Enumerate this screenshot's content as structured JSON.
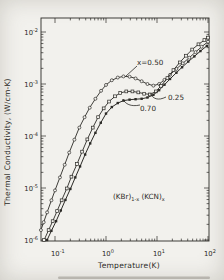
{
  "figure": {
    "background": "#f2f1ed",
    "ink": "#2b2a26"
  },
  "chart_data": {
    "type": "line",
    "title": "",
    "xlabel": "Temperature(K)",
    "ylabel": "Thermal Conductivity, (W/cm-K)",
    "x_scale": "log",
    "y_scale": "log",
    "xlim": [
      0.053,
      100
    ],
    "ylim": [
      1e-06,
      0.0185
    ],
    "grid": false,
    "legend_position": "inline-labels",
    "x_tick_exponents": [
      -1,
      0,
      1,
      2
    ],
    "y_tick_exponents": [
      -2,
      -3,
      -4,
      -5,
      -6
    ],
    "annotation": {
      "base1": "(KBr)",
      "sub1": "1-x",
      "base2": "(KCN)",
      "sub2": "x"
    },
    "series": [
      {
        "name": "x-0.50",
        "label": "x=0.50",
        "marker": "open-circle",
        "points": [
          [
            0.053,
            1.55e-06
          ],
          [
            0.06,
            2.2e-06
          ],
          [
            0.07,
            3.4e-06
          ],
          [
            0.085,
            5.8e-06
          ],
          [
            0.1,
            9e-06
          ],
          [
            0.125,
            1.6e-05
          ],
          [
            0.155,
            2.8e-05
          ],
          [
            0.19,
            4.8e-05
          ],
          [
            0.24,
            8.5e-05
          ],
          [
            0.3,
            0.000145
          ],
          [
            0.38,
            0.00023
          ],
          [
            0.48,
            0.00035
          ],
          [
            0.62,
            0.00052
          ],
          [
            0.8,
            0.00074
          ],
          [
            1.0,
            0.00096
          ],
          [
            1.3,
            0.00118
          ],
          [
            1.7,
            0.00133
          ],
          [
            2.2,
            0.0014
          ],
          [
            2.9,
            0.00138
          ],
          [
            3.8,
            0.00128
          ],
          [
            5.0,
            0.00113
          ],
          [
            6.5,
            0.001
          ],
          [
            8.5,
            0.00093
          ],
          [
            11,
            0.001
          ],
          [
            14,
            0.0012
          ],
          [
            18,
            0.0015
          ],
          [
            24,
            0.00195
          ],
          [
            32,
            0.0025
          ],
          [
            43,
            0.0032
          ],
          [
            57,
            0.0041
          ],
          [
            75,
            0.0052
          ],
          [
            100,
            0.0065
          ]
        ]
      },
      {
        "name": "x-0.25",
        "label": "0.25",
        "marker": "open-square",
        "points": [
          [
            0.061,
            1e-06
          ],
          [
            0.075,
            1.55e-06
          ],
          [
            0.09,
            2.3e-06
          ],
          [
            0.11,
            3.6e-06
          ],
          [
            0.135,
            5.8e-06
          ],
          [
            0.17,
            9.8e-06
          ],
          [
            0.21,
            1.65e-05
          ],
          [
            0.27,
            2.9e-05
          ],
          [
            0.34,
            5e-05
          ],
          [
            0.43,
            8.6e-05
          ],
          [
            0.55,
            0.000145
          ],
          [
            0.7,
            0.00023
          ],
          [
            0.9,
            0.00034
          ],
          [
            1.15,
            0.00046
          ],
          [
            1.5,
            0.00058
          ],
          [
            1.9,
            0.00067
          ],
          [
            2.5,
            0.00072
          ],
          [
            3.3,
            0.00072
          ],
          [
            4.3,
            0.00069
          ],
          [
            5.6,
            0.00065
          ],
          [
            7.3,
            0.00063
          ],
          [
            9.5,
            0.00072
          ],
          [
            12,
            0.00092
          ],
          [
            16,
            0.0013
          ],
          [
            21,
            0.00185
          ],
          [
            28,
            0.0026
          ],
          [
            37,
            0.0035
          ],
          [
            49,
            0.0046
          ],
          [
            65,
            0.0058
          ],
          [
            85,
            0.007
          ],
          [
            100,
            0.0078
          ]
        ]
      },
      {
        "name": "x-0.70",
        "label": "0.70",
        "marker": "filled-square",
        "points": [
          [
            0.07,
            1e-06
          ],
          [
            0.085,
            1.5e-06
          ],
          [
            0.105,
            2.3e-06
          ],
          [
            0.13,
            3.7e-06
          ],
          [
            0.16,
            5.9e-06
          ],
          [
            0.2,
            9.6e-06
          ],
          [
            0.25,
            1.6e-05
          ],
          [
            0.31,
            2.6e-05
          ],
          [
            0.39,
            4.4e-05
          ],
          [
            0.49,
            7.2e-05
          ],
          [
            0.62,
            0.000115
          ],
          [
            0.79,
            0.00018
          ],
          [
            1.0,
            0.00027
          ],
          [
            1.3,
            0.00036
          ],
          [
            1.7,
            0.00043
          ],
          [
            2.2,
            0.00048
          ],
          [
            2.9,
            0.0005
          ],
          [
            3.8,
            0.00051
          ],
          [
            5.0,
            0.00052
          ],
          [
            6.5,
            0.00055
          ],
          [
            8.5,
            0.00062
          ],
          [
            11,
            0.00076
          ],
          [
            14,
            0.00097
          ],
          [
            18,
            0.00125
          ],
          [
            24,
            0.00165
          ],
          [
            31,
            0.0021
          ],
          [
            41,
            0.0027
          ],
          [
            54,
            0.0034
          ],
          [
            71,
            0.0043
          ],
          [
            95,
            0.0054
          ]
        ]
      }
    ]
  }
}
